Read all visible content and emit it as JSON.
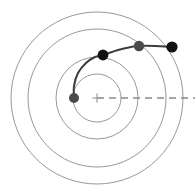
{
  "figure": {
    "width": 195,
    "height": 196,
    "background": "#ffffff"
  },
  "chart_data": {
    "type": "scatter",
    "title": "",
    "subtitle": "",
    "xlabel": "",
    "ylabel": "",
    "grid": false,
    "legend_position": "none",
    "coordinate_system": "polar-pixel",
    "center": {
      "x": 97,
      "y": 98,
      "marker": "cross",
      "color": "#9a9a9a",
      "size": 9
    },
    "orbit_circles": {
      "count": 4,
      "color": "#8c8c8c",
      "stroke_width": 0.9,
      "radii": [
        24,
        41,
        69,
        86
      ]
    },
    "reference_axis": {
      "label": "",
      "style": "dashed",
      "color": "#8a8a8a",
      "dash": "7 5",
      "from": {
        "x": 97,
        "y": 98
      },
      "to": {
        "x": 195,
        "y": 98
      }
    },
    "series": [
      {
        "name": "trajectory",
        "type": "line",
        "color": "#3d3d3d",
        "stroke_width": 2.0,
        "path_points": [
          {
            "x": 74,
            "y": 98
          },
          {
            "x": 74,
            "y": 86
          },
          {
            "x": 78,
            "y": 73
          },
          {
            "x": 86,
            "y": 63
          },
          {
            "x": 95,
            "y": 57
          },
          {
            "x": 103,
            "y": 55
          },
          {
            "x": 118,
            "y": 50
          },
          {
            "x": 131,
            "y": 47
          },
          {
            "x": 139,
            "y": 46
          },
          {
            "x": 155,
            "y": 46
          },
          {
            "x": 172,
            "y": 47
          }
        ]
      },
      {
        "name": "markers",
        "type": "scatter",
        "points": [
          {
            "x": 74,
            "y": 98,
            "r": 5.0,
            "color": "#4a4a4a",
            "label": "p0"
          },
          {
            "x": 103,
            "y": 55,
            "r": 5.4,
            "color": "#121212",
            "label": "p1"
          },
          {
            "x": 139,
            "y": 46,
            "r": 5.2,
            "color": "#4a4a4a",
            "label": "p2"
          },
          {
            "x": 172,
            "y": 47,
            "r": 5.6,
            "color": "#121212",
            "label": "p3"
          }
        ]
      }
    ],
    "xlim": [
      0,
      195
    ],
    "ylim": [
      196,
      0
    ],
    "annotations": []
  }
}
